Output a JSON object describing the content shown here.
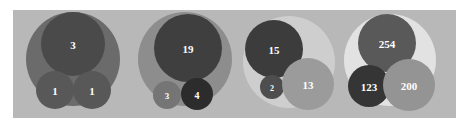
{
  "figure": {
    "title": "",
    "background_color": "#ffffff",
    "panel_color": "#b8b8b8",
    "panel": {
      "x": 13,
      "y": 10,
      "width": 443,
      "height": 108
    },
    "label_color": "#ffffff"
  },
  "chart_data": {
    "type": "circle-packing",
    "title": "",
    "subtitle": "",
    "xlabel": "",
    "ylabel": "",
    "grid": false,
    "legend": "none",
    "label_unit": "count",
    "groups": [
      {
        "name": "group-1",
        "parent": {
          "label": "",
          "value": 5,
          "color": "#6b6b6b",
          "cx": 73,
          "cy": 59,
          "r": 47
        },
        "children": [
          {
            "label": "3",
            "value": 3,
            "color": "#4a4a4a",
            "cx": 73,
            "cy": 44,
            "r": 32
          },
          {
            "label": "1",
            "value": 1,
            "color": "#585858",
            "cx": 55,
            "cy": 90,
            "r": 19
          },
          {
            "label": "1",
            "value": 1,
            "color": "#585858",
            "cx": 92,
            "cy": 90,
            "r": 19
          }
        ]
      },
      {
        "name": "group-2",
        "parent": {
          "label": "",
          "value": 26,
          "color": "#8d8d8d",
          "cx": 185,
          "cy": 59,
          "r": 47
        },
        "children": [
          {
            "label": "19",
            "value": 19,
            "color": "#3f3f3f",
            "cx": 188,
            "cy": 48,
            "r": 34
          },
          {
            "label": "3",
            "value": 3,
            "color": "#757575",
            "cx": 167,
            "cy": 95,
            "r": 14
          },
          {
            "label": "4",
            "value": 4,
            "color": "#2c2c2c",
            "cx": 197,
            "cy": 94,
            "r": 16
          }
        ]
      },
      {
        "name": "group-3",
        "parent": {
          "label": "",
          "value": 30,
          "color": "#cecece",
          "cx": 289,
          "cy": 62,
          "r": 46
        },
        "children": [
          {
            "label": "15",
            "value": 15,
            "color": "#3c3c3c",
            "cx": 274,
            "cy": 49,
            "r": 29
          },
          {
            "label": "2",
            "value": 2,
            "color": "#4e4e4e",
            "cx": 272,
            "cy": 87,
            "r": 12
          },
          {
            "label": "13",
            "value": 13,
            "color": "#9b9b9b",
            "cx": 308,
            "cy": 84,
            "r": 26
          }
        ]
      },
      {
        "name": "group-4",
        "parent": {
          "label": "",
          "value": 577,
          "color": "#e2e2e2",
          "cx": 390,
          "cy": 60,
          "r": 46
        },
        "children": [
          {
            "label": "254",
            "value": 254,
            "color": "#595959",
            "cx": 387,
            "cy": 43,
            "r": 29
          },
          {
            "label": "123",
            "value": 123,
            "color": "#353535",
            "cx": 369,
            "cy": 86,
            "r": 21
          },
          {
            "label": "200",
            "value": 200,
            "color": "#949494",
            "cx": 409,
            "cy": 85,
            "r": 26
          }
        ]
      }
    ]
  }
}
